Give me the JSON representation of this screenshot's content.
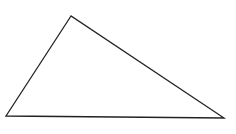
{
  "diagram": {
    "type": "triangle",
    "vertices": {
      "top": {
        "x": 71,
        "y": 16
      },
      "bottom_left": {
        "x": 6,
        "y": 116
      },
      "bottom_right": {
        "x": 224,
        "y": 118
      }
    },
    "stroke_color": "#222222",
    "fill_color": "#ffffff",
    "stroke_width": 1.3
  }
}
